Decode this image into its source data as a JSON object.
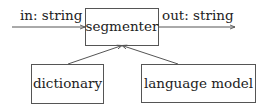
{
  "diagram": {
    "nodes": [
      {
        "id": "segmenter",
        "label": "segmenter"
      },
      {
        "id": "dictionary",
        "label": "dictionary"
      },
      {
        "id": "language_model",
        "label": "language model"
      }
    ],
    "edges": [
      {
        "from": "input",
        "to": "segmenter",
        "label": "in: string"
      },
      {
        "from": "segmenter",
        "to": "output",
        "label": "out: string"
      },
      {
        "from": "dictionary",
        "to": "segmenter",
        "label": ""
      },
      {
        "from": "language_model",
        "to": "segmenter",
        "label": ""
      }
    ]
  },
  "colors": {
    "stroke": "#555555",
    "text": "#222222",
    "background": "#ffffff"
  }
}
